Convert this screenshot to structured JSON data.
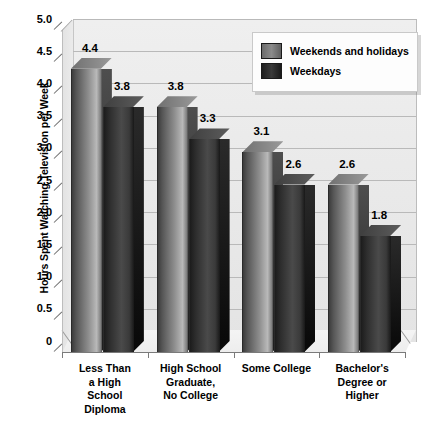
{
  "chart_data": {
    "type": "bar",
    "title": "",
    "xlabel": "",
    "ylabel": "Hours Spent Watching Television per Week",
    "ylim": [
      0,
      5.0
    ],
    "ytick_labels": [
      "0",
      "0.5",
      "1.0",
      "1.5",
      "2.0",
      "2.5",
      "3.0",
      "3.5",
      "4.0",
      "4.5",
      "5.0"
    ],
    "ytick_values": [
      0,
      0.5,
      1.0,
      1.5,
      2.0,
      2.5,
      3.0,
      3.5,
      4.0,
      4.5,
      5.0
    ],
    "grid": true,
    "legend_position": "top-right",
    "categories": [
      "Less Than\na High\nSchool\nDiploma",
      "High School\nGraduate,\nNo College",
      "Some College",
      "Bachelor's\nDegree or\nHigher"
    ],
    "series": [
      {
        "name": "Weekends and holidays",
        "color": "#8e8e8e",
        "values": [
          4.4,
          3.8,
          3.1,
          2.6
        ],
        "labels": [
          "4.4",
          "3.8",
          "3.1",
          "2.6"
        ]
      },
      {
        "name": "Weekdays",
        "color": "#2c2c2c",
        "values": [
          3.8,
          3.3,
          2.6,
          1.8
        ],
        "labels": [
          "3.8",
          "3.3",
          "2.6",
          "1.8"
        ]
      }
    ]
  },
  "legend": {
    "entries": [
      {
        "label": "Weekends and holidays"
      },
      {
        "label": "Weekdays"
      }
    ]
  },
  "caption": {
    "text": ""
  }
}
